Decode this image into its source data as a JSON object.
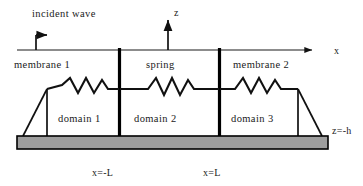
{
  "figure": {
    "title_caption": "",
    "background_color": "#ffffff",
    "line_color": "#1a1a1a",
    "base_fill_color": "#9e9e9e"
  },
  "labels": {
    "incident_wave": "incident wave",
    "axis_z": "z",
    "axis_x": "x",
    "membrane_1": "membrane 1",
    "spring": "spring",
    "membrane_2": "membrane 2",
    "domain_1": "domain 1",
    "domain_2": "domain 2",
    "domain_3": "domain 3",
    "x_minus_L": "x=-L",
    "x_plus_L": "x=L",
    "z_equals_minus_h": "z=-h"
  },
  "geometry": {
    "x_axis_y": 50,
    "x_axis_start": 17,
    "x_axis_end": 318,
    "z_axis_x": 168,
    "z_axis_top": 14,
    "interface_left_x": 119,
    "interface_right_x": 219,
    "membrane_level_y": 89,
    "base_top_y": 136,
    "base_bottom_y": 149,
    "base_left_x": 17,
    "base_right_x": 328
  },
  "icons": {
    "incident_wave_arrow": "arrow-right-icon",
    "z_axis_arrow": "arrow-up-icon",
    "x_axis_arrow": "arrow-right-icon"
  }
}
